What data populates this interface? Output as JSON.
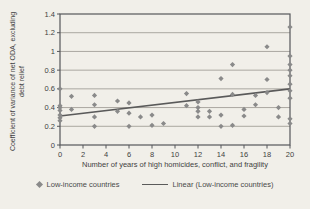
{
  "colors": {
    "background": "#f1efe9",
    "gridline": "#aaa7a0",
    "plot_border": "#55565a",
    "marker": "#8a8a8a",
    "trend_line": "#5a5a5a",
    "text": "#3f3f3f"
  },
  "legend": {
    "scatter_label": "Low-income countries",
    "line_label": "Linear (Low-income countries)"
  },
  "chart_data": {
    "type": "scatter",
    "title": "",
    "xlabel": "Number of years of high homicides, conflict, and fragility",
    "ylabel": "Coefficient of variance of net ODA, excluding debt relief",
    "xlim": [
      0,
      20
    ],
    "ylim": [
      0,
      1.4
    ],
    "x_ticks": [
      "0",
      "2",
      "4",
      "6",
      "8",
      "10",
      "12",
      "14",
      "16",
      "18",
      "20"
    ],
    "y_ticks": [
      "0",
      "0.2",
      "0.4",
      "0.6",
      "0.8",
      "1",
      "1.2",
      "1.4"
    ],
    "grid": "horizontal",
    "legend_position": "bottom",
    "series": [
      {
        "name": "Low-income countries",
        "marker": "diamond",
        "points": [
          [
            0,
            0.6
          ],
          [
            0,
            0.42
          ],
          [
            0,
            0.4
          ],
          [
            0,
            0.37
          ],
          [
            0,
            0.32
          ],
          [
            0,
            0.29
          ],
          [
            0,
            0.26
          ],
          [
            1,
            0.52
          ],
          [
            1,
            0.38
          ],
          [
            3,
            0.53
          ],
          [
            3,
            0.43
          ],
          [
            3,
            0.3
          ],
          [
            3,
            0.2
          ],
          [
            5,
            0.47
          ],
          [
            5,
            0.36
          ],
          [
            6,
            0.45
          ],
          [
            6,
            0.34
          ],
          [
            6,
            0.2
          ],
          [
            7,
            0.3
          ],
          [
            8,
            0.32
          ],
          [
            8,
            0.21
          ],
          [
            9,
            0.23
          ],
          [
            11,
            0.55
          ],
          [
            11,
            0.42
          ],
          [
            12,
            0.46
          ],
          [
            12,
            0.4
          ],
          [
            12,
            0.36
          ],
          [
            12,
            0.3
          ],
          [
            13,
            0.36
          ],
          [
            13,
            0.3
          ],
          [
            14,
            0.71
          ],
          [
            14,
            0.32
          ],
          [
            14,
            0.2
          ],
          [
            15,
            0.86
          ],
          [
            15,
            0.54
          ],
          [
            15,
            0.21
          ],
          [
            16,
            0.38
          ],
          [
            16,
            0.31
          ],
          [
            17,
            0.53
          ],
          [
            17,
            0.43
          ],
          [
            18,
            1.05
          ],
          [
            18,
            0.7
          ],
          [
            18,
            0.56
          ],
          [
            19,
            0.4
          ],
          [
            19,
            0.3
          ],
          [
            20,
            1.26
          ],
          [
            20,
            0.95
          ],
          [
            20,
            0.86
          ],
          [
            20,
            0.8
          ],
          [
            20,
            0.74
          ],
          [
            20,
            0.65
          ],
          [
            20,
            0.58
          ],
          [
            20,
            0.5
          ],
          [
            20,
            0.28
          ],
          [
            20,
            0.23
          ]
        ]
      },
      {
        "name": "Linear (Low-income countries)",
        "type": "line",
        "trend": {
          "x1": 0,
          "y1": 0.31,
          "x2": 20,
          "y2": 0.6
        }
      }
    ]
  }
}
